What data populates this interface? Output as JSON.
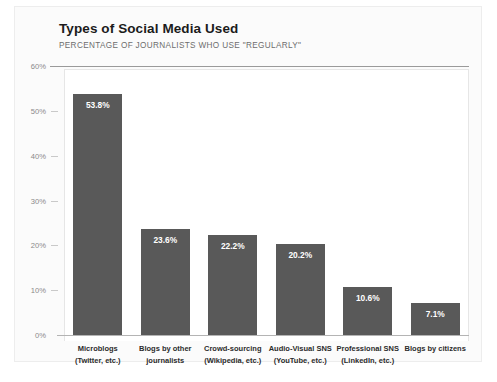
{
  "chart_data": {
    "type": "bar",
    "title": "Types of Social Media Used",
    "subtitle": "PERCENTAGE OF JOURNALISTS WHO USE \"REGULARLY\"",
    "xlabel": "",
    "ylabel": "",
    "ylim": [
      0,
      60
    ],
    "ytick_labels": [
      "0%",
      "10%",
      "20%",
      "30%",
      "40%",
      "50%",
      "60%"
    ],
    "ytick_values": [
      0,
      10,
      20,
      30,
      40,
      50,
      60
    ],
    "grid": false,
    "legend": false,
    "bar_color": "#595959",
    "value_label_color": "#ffffff",
    "categories": [
      {
        "line1": "Microblogs",
        "line2": "(Twitter, etc.)"
      },
      {
        "line1": "Blogs by other",
        "line2": "journalists"
      },
      {
        "line1": "Crowd-sourcing",
        "line2": "(Wikipedia, etc.)"
      },
      {
        "line1": "Audio-Visual SNS",
        "line2": "(YouTube, etc.)"
      },
      {
        "line1": "Professional SNS",
        "line2": "(LinkedIn, etc.)"
      },
      {
        "line1": "Blogs by citizens",
        "line2": ""
      }
    ],
    "values": [
      53.8,
      23.6,
      22.2,
      20.2,
      10.6,
      7.1
    ],
    "value_labels": [
      "53.8%",
      "23.6%",
      "22.2%",
      "20.2%",
      "10.6%",
      "7.1%"
    ]
  }
}
